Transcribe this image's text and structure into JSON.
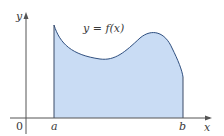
{
  "diagram": {
    "type": "area-under-curve",
    "curve_label": "y = f(x)",
    "axis_labels": {
      "x": "x",
      "y": "y",
      "origin": "0"
    },
    "interval_labels": {
      "left": "a",
      "right": "b"
    },
    "colors": {
      "fill": "#c9dcf4",
      "curve": "#2f4f7f",
      "axis": "#555555",
      "boundary": "#3a4a66"
    }
  }
}
